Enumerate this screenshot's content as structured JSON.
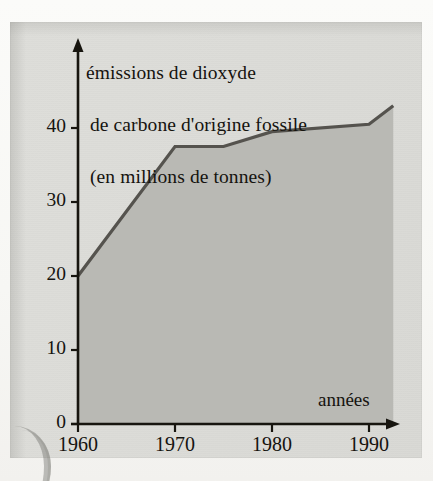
{
  "figure": {
    "title_lines": [
      "émissions de dioxyde",
      "de carbone d'origine fossile",
      "(en millions de tonnes)"
    ],
    "x_axis_label": "années",
    "colors": {
      "paper": "#f7f7f4",
      "plate": "#dcdcd8",
      "area_fill": "#b9b9b4",
      "curve": "#55534e",
      "axis": "#17150f",
      "text": "#15130f"
    }
  },
  "chart_data": {
    "type": "area",
    "title": "émissions de dioxyde de carbone d'origine fossile (en millions de tonnes)",
    "xlabel": "années",
    "ylabel": "émissions de dioxyde de carbone d'origine fossile (en millions de tonnes)",
    "xlim": [
      1960,
      1992.5
    ],
    "ylim": [
      0,
      45
    ],
    "grid": false,
    "legend": null,
    "x_ticks": [
      1960,
      1970,
      1980,
      1990
    ],
    "x_tick_labels": [
      "1960",
      "1970",
      "1980",
      "1990"
    ],
    "y_ticks": [
      0,
      10,
      20,
      30,
      40
    ],
    "y_tick_labels": [
      "0",
      "10",
      "20",
      "30",
      "40"
    ],
    "series": [
      {
        "name": "émissions de dioxyde de carbone d'origine fossile",
        "x": [
          1960,
          1970,
          1975,
          1980,
          1990,
          1992.5
        ],
        "values": [
          20,
          37.5,
          37.5,
          39.5,
          40.5,
          43
        ]
      }
    ]
  }
}
